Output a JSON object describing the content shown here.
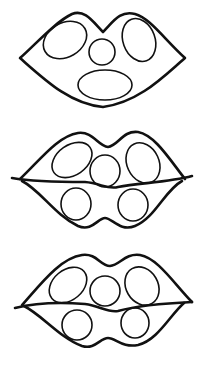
{
  "figure": {
    "width": 202,
    "height": 366,
    "background": "#ffffff",
    "stroke_color": "#111111",
    "panels": [
      {
        "id": "lips-closed",
        "label": ""
      },
      {
        "id": "lips-parted-1",
        "label": ""
      },
      {
        "id": "lips-parted-2",
        "label": ""
      }
    ]
  }
}
